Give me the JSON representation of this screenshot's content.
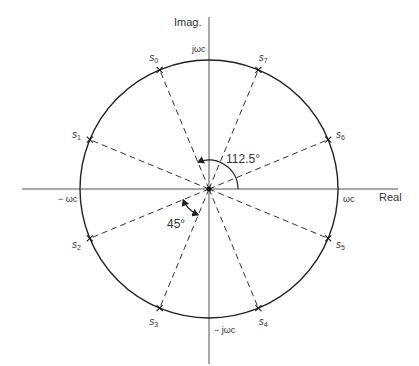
{
  "diagram": {
    "axes": {
      "real_label": "Real",
      "imag_label": "Imag."
    },
    "intercepts": {
      "pos_real": "ωc",
      "neg_real": "− ωc",
      "pos_imag": "jωc",
      "neg_imag": "− jωc"
    },
    "poles": [
      {
        "label": "s0",
        "sub": "0",
        "angle_deg": 112.5
      },
      {
        "label": "s1",
        "sub": "1",
        "angle_deg": 157.5
      },
      {
        "label": "s2",
        "sub": "2",
        "angle_deg": 202.5
      },
      {
        "label": "s3",
        "sub": "3",
        "angle_deg": 247.5
      },
      {
        "label": "s4",
        "sub": "4",
        "angle_deg": 292.5
      },
      {
        "label": "s5",
        "sub": "5",
        "angle_deg": 337.5
      },
      {
        "label": "s6",
        "sub": "6",
        "angle_deg": 22.5
      },
      {
        "label": "s7",
        "sub": "7",
        "angle_deg": 67.5
      }
    ],
    "angle_annotations": [
      {
        "text": "112.5°",
        "from_deg": 0,
        "to_deg": 112.5
      },
      {
        "text": "45°",
        "from_deg": 202.5,
        "to_deg": 247.5
      }
    ],
    "colors": {
      "line": "#222222",
      "text": "#333333"
    }
  }
}
